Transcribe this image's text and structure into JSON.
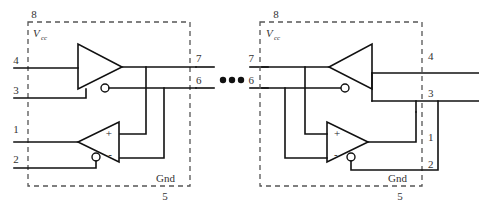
{
  "figure": {
    "ellipsis": "●●●",
    "symbols": {
      "plus": "+",
      "minus": "-"
    },
    "colors": {
      "wire": "#111111",
      "dashed_boundary": "#555555",
      "label_text": "#333333",
      "background": "#ffffff"
    }
  },
  "blocks": [
    {
      "name": "left-ic-block",
      "power_pin": {
        "number": "8",
        "label": "Vcc",
        "label_base": "V",
        "label_sub": "cc"
      },
      "ground_pin": {
        "number": "5",
        "label": "Gnd"
      },
      "left_pins": [
        {
          "number": "4"
        },
        {
          "number": "3"
        },
        {
          "number": "1"
        },
        {
          "number": "2"
        }
      ],
      "right_pins": [
        {
          "number": "7"
        },
        {
          "number": "6"
        }
      ],
      "gates": [
        {
          "name": "buffer-inverter",
          "orientation": "points-right",
          "inverting_bubble": true
        },
        {
          "name": "comparator",
          "orientation": "points-left",
          "inverting_bubble": true,
          "inputs": [
            {
              "polarity": "+"
            },
            {
              "polarity": "-"
            }
          ]
        }
      ]
    },
    {
      "name": "right-ic-block",
      "power_pin": {
        "number": "8",
        "label": "Vcc",
        "label_base": "V",
        "label_sub": "cc"
      },
      "ground_pin": {
        "number": "5",
        "label": "Gnd"
      },
      "left_pins": [
        {
          "number": "7"
        },
        {
          "number": "6"
        }
      ],
      "right_pins": [
        {
          "number": "4"
        },
        {
          "number": "3"
        },
        {
          "number": "1"
        },
        {
          "number": "2"
        }
      ],
      "gates": [
        {
          "name": "buffer-inverter",
          "orientation": "points-left",
          "inverting_bubble": true
        },
        {
          "name": "comparator",
          "orientation": "points-right",
          "inverting_bubble": true,
          "inputs": [
            {
              "polarity": "+"
            },
            {
              "polarity": "-"
            }
          ]
        }
      ]
    }
  ]
}
